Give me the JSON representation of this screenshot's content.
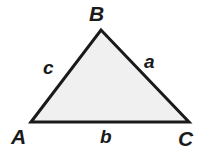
{
  "figure": {
    "background_color": "#ffffff"
  },
  "diagram": {
    "type": "triangle",
    "fill_color": "#f0f0f0",
    "stroke_color": "#1a1a1a",
    "stroke_width": 3,
    "vertices": [
      {
        "name": "A",
        "label": "A",
        "x": 31,
        "y": 122
      },
      {
        "name": "B",
        "label": "B",
        "x": 101,
        "y": 30
      },
      {
        "name": "C",
        "label": "C",
        "x": 189,
        "y": 122
      }
    ],
    "sides": [
      {
        "name": "a",
        "label": "a",
        "between": "B-C"
      },
      {
        "name": "b",
        "label": "b",
        "between": "A-C"
      },
      {
        "name": "c",
        "label": "c",
        "between": "A-B"
      }
    ],
    "points_path": "31,122 101,30 189,122"
  },
  "labels": {
    "vertex_A": "A",
    "vertex_B": "B",
    "vertex_C": "C",
    "side_a": "a",
    "side_b": "b",
    "side_c": "c"
  }
}
